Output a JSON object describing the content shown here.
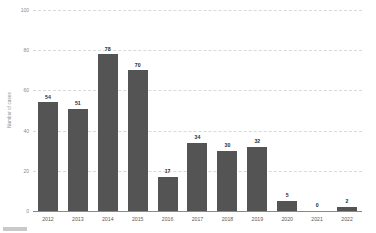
{
  "chart_data": {
    "type": "bar",
    "title": "",
    "subtitle": "",
    "xlabel": "",
    "ylabel": "Number of cases",
    "categories": [
      "2012",
      "2013",
      "2014",
      "2015",
      "2016",
      "2017",
      "2018",
      "2019",
      "2020",
      "2021",
      "2022"
    ],
    "values": [
      54,
      51,
      78,
      70,
      17,
      34,
      30,
      32,
      5,
      0,
      2
    ],
    "value_labels": [
      "54",
      "51",
      "78",
      "70",
      "17",
      "34",
      "30",
      "32",
      "5",
      "0",
      "2"
    ],
    "ylim": [
      0,
      100
    ],
    "yticks": [
      0,
      20,
      40,
      60,
      80,
      100
    ],
    "ytick_labels": [
      "0",
      "20",
      "40",
      "60",
      "80",
      "100"
    ],
    "grid": true,
    "grid_style": "dashed",
    "legend": false,
    "legend_position": "none",
    "bar_color": "#545454",
    "grid_color": "#d9d9d9",
    "axis_color": "#8a8a8a",
    "label_color": "#2b2b2b",
    "background": "#ffffff"
  }
}
